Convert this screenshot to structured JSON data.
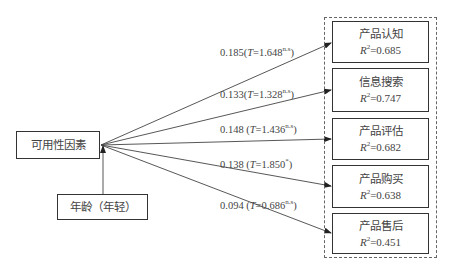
{
  "diagram": {
    "source_node": {
      "label": "可用性因素"
    },
    "moderator_node": {
      "label": "年龄（年轻）"
    },
    "targets": [
      {
        "label": "产品认知",
        "r2_prefix": "R",
        "r2_sup": "2",
        "r2_value": "=0.685"
      },
      {
        "label": "信息搜索",
        "r2_prefix": "R",
        "r2_sup": "2",
        "r2_value": "=0.747"
      },
      {
        "label": "产品评估",
        "r2_prefix": "R",
        "r2_sup": "2",
        "r2_value": "=0.682"
      },
      {
        "label": "产品购买",
        "r2_prefix": "R",
        "r2_sup": "2",
        "r2_value": "=0.638"
      },
      {
        "label": "产品售后",
        "r2_prefix": "R",
        "r2_sup": "2",
        "r2_value": "=0.451"
      }
    ],
    "paths": [
      {
        "coef": "0.185(",
        "t_label": "T",
        "t_value": "=1.648",
        "sig": "n.s",
        "close": ")"
      },
      {
        "coef": "0.133(",
        "t_label": "T",
        "t_value": "=1.328",
        "sig": "n.s",
        "close": ")"
      },
      {
        "coef": "0.148 (",
        "t_label": "T",
        "t_value": "=1.436",
        "sig": "n.s",
        "close": ")"
      },
      {
        "coef": "0.138 (",
        "t_label": "T",
        "t_value": "=1.850",
        "sig": "*",
        "close": ")"
      },
      {
        "coef": "0.094 (",
        "t_label": "T",
        "t_value": "=0.686",
        "sig": "n.s",
        "close": ")"
      }
    ],
    "colors": {
      "line": "#333333",
      "text": "#444444",
      "background": "#ffffff"
    }
  }
}
